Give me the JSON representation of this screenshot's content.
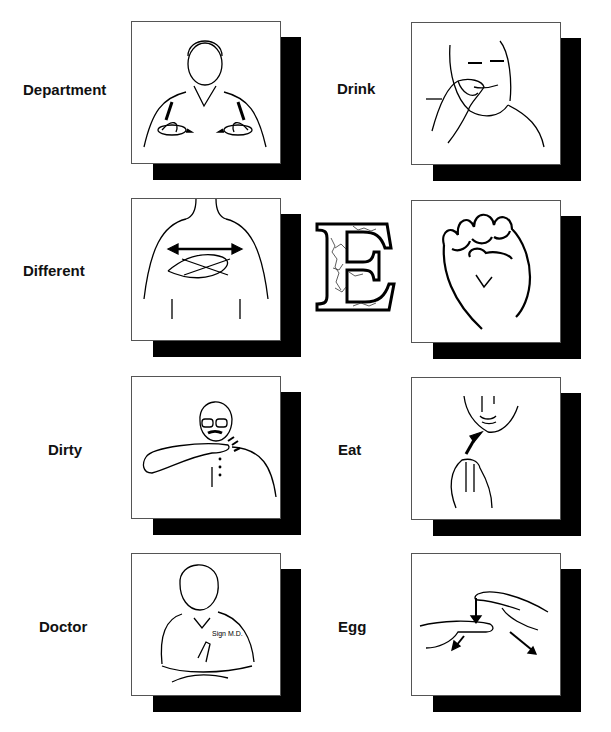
{
  "page": {
    "letter": "E",
    "entries": [
      {
        "word": "Department",
        "column": "left",
        "illustration": "person-signing-department"
      },
      {
        "word": "Different",
        "column": "left",
        "illustration": "hands-crossed-index-fingers"
      },
      {
        "word": "Dirty",
        "column": "left",
        "illustration": "man-hand-under-chin-wiggling"
      },
      {
        "word": "Doctor",
        "column": "left",
        "illustration": "man-tapping-wrist",
        "shirt_text": "Sign M.D."
      },
      {
        "word": "Drink",
        "column": "right",
        "illustration": "girl-drinking-sign"
      },
      {
        "word": "",
        "column": "right",
        "illustration": "fist-letter-e-handshape"
      },
      {
        "word": "Eat",
        "column": "right",
        "illustration": "hand-to-mouth-arrow"
      },
      {
        "word": "Egg",
        "column": "right",
        "illustration": "two-fingers-breaking-egg"
      }
    ]
  }
}
